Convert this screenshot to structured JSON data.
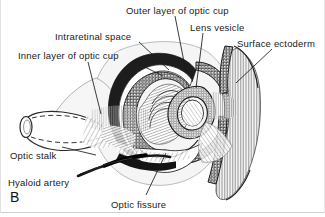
{
  "figure": {
    "panel_label": "B",
    "background_color": "#ffffff",
    "ink_color": "#1a1a1a",
    "border_color": "#c8c8c8"
  },
  "labels": [
    {
      "id": "outer-layer-of-optic-cup",
      "text": "Outer layer of optic cup",
      "x": 126,
      "y": 5,
      "anchor": "start"
    },
    {
      "id": "lens-vesicle",
      "text": "Lens vesicle",
      "x": 190,
      "y": 22,
      "anchor": "start"
    },
    {
      "id": "surface-ectoderm",
      "text": "Surface ectoderm",
      "x": 237,
      "y": 38,
      "anchor": "start"
    },
    {
      "id": "intraretinal-space",
      "text": "Intraretinal space",
      "x": 55,
      "y": 31,
      "anchor": "start"
    },
    {
      "id": "inner-layer-of-optic-cup",
      "text": "Inner layer of optic cup",
      "x": 18,
      "y": 50,
      "anchor": "start"
    },
    {
      "id": "optic-stalk",
      "text": "Optic stalk",
      "x": 10,
      "y": 150,
      "anchor": "start"
    },
    {
      "id": "hyaloid-artery",
      "text": "Hyaloid artery",
      "x": 8,
      "y": 177,
      "anchor": "start"
    },
    {
      "id": "optic-fissure",
      "text": "Optic fissure",
      "x": 111,
      "y": 199,
      "anchor": "start"
    }
  ],
  "leader_lines": [
    {
      "id": "leader-outer-layer-of-optic-cup",
      "from": [
        175,
        16
      ],
      "to": [
        186,
        72
      ]
    },
    {
      "id": "leader-lens-vesicle",
      "from": [
        203,
        33
      ],
      "to": [
        196,
        88
      ]
    },
    {
      "id": "leader-surface-ectoderm",
      "from": [
        272,
        49
      ],
      "to": [
        236,
        83
      ]
    },
    {
      "id": "leader-intraretinal-space",
      "from": [
        139,
        42
      ],
      "to": [
        169,
        70
      ]
    },
    {
      "id": "leader-inner-layer-of-optic-cup",
      "from": [
        133,
        61
      ],
      "to": [
        163,
        76
      ]
    },
    {
      "id": "leader-inner-layer-branch",
      "from": [
        88,
        62
      ],
      "to": [
        101,
        114
      ]
    },
    {
      "id": "leader-optic-stalk",
      "from": [
        62,
        147
      ],
      "to": [
        96,
        155
      ]
    },
    {
      "id": "leader-hyaloid-artery",
      "from": [
        80,
        174
      ],
      "to": [
        120,
        160
      ]
    },
    {
      "id": "leader-optic-fissure",
      "from": [
        146,
        195
      ],
      "to": [
        166,
        153
      ]
    }
  ],
  "structures": [
    {
      "id": "optic-cup-outer-layer",
      "description": "pigmented outer wall of optic cup, dark stippled band"
    },
    {
      "id": "optic-cup-inner-layer",
      "description": "thick inner neural layer of optic cup with beaded nuclei"
    },
    {
      "id": "intraretinal-space",
      "description": "narrow cleft between inner and outer layers of optic cup"
    },
    {
      "id": "lens-vesicle",
      "description": "spherical epithelial vesicle sunk into mouth of optic cup"
    },
    {
      "id": "surface-ectoderm",
      "description": "sheet of surface ectoderm overlying the lens vesicle"
    },
    {
      "id": "optic-stalk",
      "description": "tubular stalk connecting optic cup to forebrain, drawn cut"
    },
    {
      "id": "hyaloid-artery",
      "description": "dark vessel running in the optic fissure toward the lens"
    },
    {
      "id": "optic-fissure",
      "description": "groove on inferior aspect of optic cup and stalk"
    }
  ]
}
